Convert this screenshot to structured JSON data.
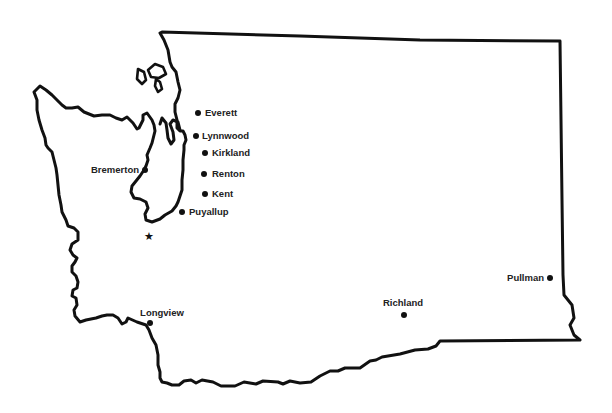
{
  "map": {
    "region": "Washington State",
    "stroke_color": "#111111",
    "background": "#ffffff",
    "capital_marker": {
      "icon": "star-icon",
      "symbol": "★",
      "x": 149,
      "y": 240
    },
    "cities": [
      {
        "name": "Everett",
        "x": 198,
        "y": 113,
        "label_x": 205,
        "label_y": 116,
        "anchor": "start"
      },
      {
        "name": "Lynnwood",
        "x": 196,
        "y": 136,
        "label_x": 202,
        "label_y": 139,
        "anchor": "start"
      },
      {
        "name": "Kirkland",
        "x": 205,
        "y": 153,
        "label_x": 212,
        "label_y": 156,
        "anchor": "start"
      },
      {
        "name": "Renton",
        "x": 204,
        "y": 174,
        "label_x": 212,
        "label_y": 177,
        "anchor": "start"
      },
      {
        "name": "Kent",
        "x": 205,
        "y": 194,
        "label_x": 212,
        "label_y": 197,
        "anchor": "start"
      },
      {
        "name": "Bremerton",
        "x": 145,
        "y": 170,
        "label_x": 139,
        "label_y": 173,
        "anchor": "end"
      },
      {
        "name": "Puyallup",
        "x": 182,
        "y": 212,
        "label_x": 189,
        "label_y": 215,
        "anchor": "start"
      },
      {
        "name": "Longview",
        "x": 150,
        "y": 323,
        "label_x": 162,
        "label_y": 316,
        "anchor": "middle"
      },
      {
        "name": "Richland",
        "x": 404,
        "y": 315,
        "label_x": 403,
        "label_y": 306,
        "anchor": "middle"
      },
      {
        "name": "Pullman",
        "x": 550,
        "y": 278,
        "label_x": 544,
        "label_y": 281,
        "anchor": "end"
      }
    ]
  }
}
